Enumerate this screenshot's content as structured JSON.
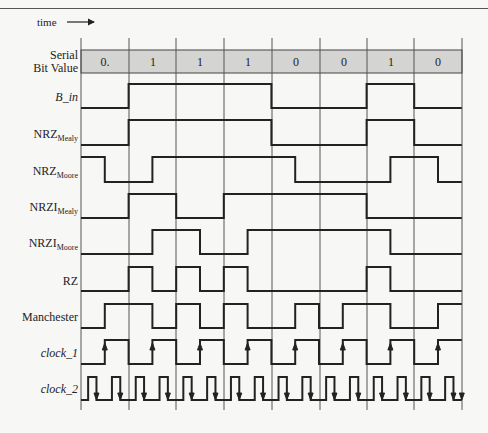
{
  "header": {
    "time_label": "time"
  },
  "bit_row": {
    "label_line1": "Serial",
    "label_line2": "Bit Value",
    "bits": [
      "0.",
      "1",
      "1",
      "1",
      "0",
      "0",
      "1",
      "0"
    ]
  },
  "signals": [
    {
      "name": "B_in",
      "sub": "",
      "italic": true
    },
    {
      "name": "NRZ",
      "sub": "Mealy",
      "italic": false
    },
    {
      "name": "NRZ",
      "sub": "Moore",
      "italic": false
    },
    {
      "name": "NRZI",
      "sub": "Mealy",
      "italic": false
    },
    {
      "name": "NRZI",
      "sub": "Moore",
      "italic": false
    },
    {
      "name": "RZ",
      "sub": "",
      "italic": false
    },
    {
      "name": "Manchester",
      "sub": "",
      "italic": false
    },
    {
      "name": "clock_1",
      "sub": "",
      "italic": true
    },
    {
      "name": "clock_2",
      "sub": "",
      "italic": true
    }
  ],
  "waveforms_half_bits": {
    "B_in": [
      0,
      0,
      1,
      1,
      1,
      1,
      1,
      1,
      0,
      0,
      0,
      0,
      1,
      1,
      0,
      0
    ],
    "NRZ_Mealy": [
      0,
      0,
      1,
      1,
      1,
      1,
      1,
      1,
      0,
      0,
      0,
      0,
      1,
      1,
      0,
      0
    ],
    "NRZ_Moore": [
      1,
      0,
      0,
      1,
      1,
      1,
      1,
      1,
      1,
      0,
      0,
      0,
      0,
      1,
      1,
      0
    ],
    "NRZI_Mealy": [
      0,
      0,
      1,
      1,
      0,
      0,
      1,
      1,
      1,
      1,
      1,
      1,
      0,
      0,
      0,
      0
    ],
    "NRZI_Moore": [
      0,
      0,
      0,
      1,
      1,
      0,
      0,
      1,
      1,
      1,
      1,
      1,
      1,
      0,
      0,
      0
    ],
    "RZ": [
      0,
      0,
      1,
      0,
      1,
      0,
      1,
      0,
      0,
      0,
      0,
      0,
      1,
      0,
      0,
      0
    ],
    "Manchester": [
      0,
      1,
      1,
      0,
      1,
      0,
      1,
      0,
      0,
      1,
      0,
      1,
      1,
      0,
      0,
      1
    ],
    "clock_1": [
      0,
      1,
      0,
      1,
      0,
      1,
      0,
      1,
      0,
      1,
      0,
      1,
      0,
      1,
      0,
      1
    ]
  },
  "colors": {
    "band": "#d4d4d2",
    "line": "#222222",
    "grid": "#555555",
    "background": "#f7f7f5"
  }
}
